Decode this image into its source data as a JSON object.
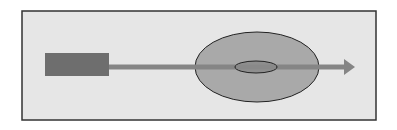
{
  "diagram": {
    "colors": {
      "background": "#ffffff",
      "frame_fill": "#e6e6e6",
      "frame_stroke": "#333333",
      "source_block": "#6e6e6e",
      "beam": "#858585",
      "outer_ellipse": "#a9a9a9",
      "inner_ellipse": "#8a8a8a",
      "ellipse_stroke": "#222222"
    },
    "elements": [
      "source-block",
      "beam-arrow",
      "outer-ellipse",
      "inner-ellipse"
    ]
  }
}
